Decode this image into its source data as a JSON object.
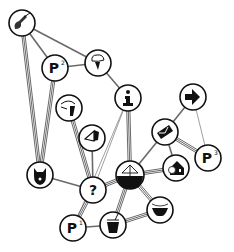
{
  "diagram": {
    "type": "network",
    "background": "#ffffff",
    "node_stroke": "#111111",
    "edge_color": "#6a6a6a",
    "nodes": [
      {
        "id": "guitar",
        "icon": "guitar-icon",
        "x": 22,
        "y": 23,
        "r": 13,
        "label": ""
      },
      {
        "id": "p2",
        "icon": "parking-icon",
        "x": 55,
        "y": 68,
        "r": 13,
        "label": "P",
        "sup": "2"
      },
      {
        "id": "weather",
        "icon": "cloud-rain-icon",
        "x": 98,
        "y": 63,
        "r": 13,
        "label": ""
      },
      {
        "id": "info",
        "icon": "info-icon",
        "x": 128,
        "y": 98,
        "r": 13,
        "label": "i"
      },
      {
        "id": "tools",
        "icon": "tools-icon",
        "x": 69,
        "y": 108,
        "r": 13,
        "label": ""
      },
      {
        "id": "sail",
        "icon": "sailboat-icon",
        "x": 92,
        "y": 138,
        "r": 13,
        "label": ""
      },
      {
        "id": "arrow",
        "icon": "arrow-right-icon",
        "x": 193,
        "y": 97,
        "r": 13,
        "label": ""
      },
      {
        "id": "mail",
        "icon": "envelope-icon",
        "x": 165,
        "y": 132,
        "r": 13,
        "label": ""
      },
      {
        "id": "p3",
        "icon": "parking-icon",
        "x": 208,
        "y": 158,
        "r": 13,
        "label": "P",
        "sup": "3"
      },
      {
        "id": "cat",
        "icon": "cat-mask-icon",
        "x": 40,
        "y": 175,
        "r": 13,
        "label": ""
      },
      {
        "id": "help",
        "icon": "question-icon",
        "x": 93,
        "y": 190,
        "r": 13,
        "label": "?"
      },
      {
        "id": "ship",
        "icon": "ship-hub-icon",
        "x": 130,
        "y": 175,
        "r": 14,
        "label": ""
      },
      {
        "id": "house",
        "icon": "house-icon",
        "x": 176,
        "y": 168,
        "r": 13,
        "label": ""
      },
      {
        "id": "p1",
        "icon": "parking-icon",
        "x": 73,
        "y": 228,
        "r": 13,
        "label": "P",
        "sup": "1"
      },
      {
        "id": "cup",
        "icon": "cup-icon",
        "x": 113,
        "y": 225,
        "r": 13,
        "label": ""
      },
      {
        "id": "bowl",
        "icon": "bowl-icon",
        "x": 160,
        "y": 210,
        "r": 13,
        "label": ""
      }
    ],
    "edges": [
      {
        "from": "guitar",
        "to": "p2",
        "style": "single"
      },
      {
        "from": "guitar",
        "to": "weather",
        "style": "single"
      },
      {
        "from": "guitar",
        "to": "cat",
        "style": "double"
      },
      {
        "from": "p2",
        "to": "weather",
        "style": "single"
      },
      {
        "from": "p2",
        "to": "cat",
        "style": "double"
      },
      {
        "from": "weather",
        "to": "info",
        "style": "single"
      },
      {
        "from": "tools",
        "to": "help",
        "style": "double"
      },
      {
        "from": "sail",
        "to": "help",
        "style": "single"
      },
      {
        "from": "info",
        "to": "help",
        "style": "thin"
      },
      {
        "from": "info",
        "to": "ship",
        "style": "double"
      },
      {
        "from": "info",
        "to": "p1",
        "style": "thin"
      },
      {
        "from": "arrow",
        "to": "mail",
        "style": "single"
      },
      {
        "from": "arrow",
        "to": "p3",
        "style": "thin"
      },
      {
        "from": "mail",
        "to": "p3",
        "style": "double"
      },
      {
        "from": "mail",
        "to": "ship",
        "style": "single"
      },
      {
        "from": "mail",
        "to": "house",
        "style": "single"
      },
      {
        "from": "cat",
        "to": "help",
        "style": "single"
      },
      {
        "from": "help",
        "to": "ship",
        "style": "double"
      },
      {
        "from": "help",
        "to": "p1",
        "style": "double"
      },
      {
        "from": "ship",
        "to": "house",
        "style": "double"
      },
      {
        "from": "ship",
        "to": "cup",
        "style": "double"
      },
      {
        "from": "ship",
        "to": "bowl",
        "style": "double"
      },
      {
        "from": "p1",
        "to": "cup",
        "style": "single"
      },
      {
        "from": "cup",
        "to": "bowl",
        "style": "double"
      }
    ]
  }
}
